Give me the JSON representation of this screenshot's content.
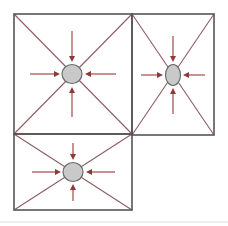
{
  "figure": {
    "canvas": {
      "width": 228,
      "height": 226
    },
    "colors": {
      "background": "#ffffff",
      "cell_border": "#555555",
      "diagonal": "#8d5d63",
      "node_fill": "#c9c9c9",
      "node_stroke": "#6b6b6b",
      "arrow": "#a04848",
      "arrow_head": "#8e3a3a",
      "bottom_rule": "#d9d9d9"
    },
    "cells": [
      {
        "id": "cell-top-left",
        "label": "top-left cell",
        "x": 14,
        "y": 14,
        "width": 118,
        "height": 120,
        "node": {
          "label": "top-left node",
          "cx": 72,
          "cy": 74,
          "rx": 10,
          "ry": 9.5,
          "shape": "circle"
        },
        "arrows": [
          {
            "direction": "right",
            "label": "arrow-from-left",
            "x1": 30,
            "y1": 74,
            "x2": 60,
            "y2": 74
          },
          {
            "direction": "left",
            "label": "arrow-from-right",
            "x1": 116,
            "y1": 74,
            "x2": 85,
            "y2": 74
          },
          {
            "direction": "down",
            "label": "arrow-from-top",
            "x1": 72,
            "y1": 31,
            "x2": 72,
            "y2": 62
          },
          {
            "direction": "up",
            "label": "arrow-from-bottom",
            "x1": 72,
            "y1": 117,
            "x2": 72,
            "y2": 87
          }
        ]
      },
      {
        "id": "cell-right",
        "label": "right cell",
        "x": 132,
        "y": 14,
        "width": 82,
        "height": 121,
        "node": {
          "label": "right node",
          "cx": 173,
          "cy": 75,
          "rx": 7.5,
          "ry": 10.5,
          "shape": "ellipse"
        },
        "arrows": [
          {
            "direction": "right",
            "label": "arrow-from-left",
            "x1": 141,
            "y1": 75,
            "x2": 163,
            "y2": 75
          },
          {
            "direction": "left",
            "label": "arrow-from-right",
            "x1": 205,
            "y1": 75,
            "x2": 183,
            "y2": 75
          },
          {
            "direction": "down",
            "label": "arrow-from-top",
            "x1": 173,
            "y1": 36,
            "x2": 173,
            "y2": 62
          },
          {
            "direction": "up",
            "label": "arrow-from-bottom",
            "x1": 173,
            "y1": 114,
            "x2": 173,
            "y2": 88
          }
        ]
      },
      {
        "id": "cell-bottom-left",
        "label": "bottom-left cell",
        "x": 14,
        "y": 134,
        "width": 118,
        "height": 76,
        "node": {
          "label": "bottom-left node",
          "cx": 73,
          "cy": 172,
          "rx": 10,
          "ry": 9.5,
          "shape": "circle"
        },
        "arrows": [
          {
            "direction": "right",
            "label": "arrow-from-left",
            "x1": 32,
            "y1": 172,
            "x2": 61,
            "y2": 172
          },
          {
            "direction": "left",
            "label": "arrow-from-right",
            "x1": 115,
            "y1": 172,
            "x2": 86,
            "y2": 172
          },
          {
            "direction": "down",
            "label": "arrow-from-top",
            "x1": 73,
            "y1": 143,
            "x2": 73,
            "y2": 160
          },
          {
            "direction": "up",
            "label": "arrow-from-bottom",
            "x1": 73,
            "y1": 201,
            "x2": 73,
            "y2": 184
          }
        ]
      }
    ],
    "bottom_rule": {
      "x1": 0,
      "y1": 222,
      "x2": 228,
      "y2": 222
    }
  }
}
